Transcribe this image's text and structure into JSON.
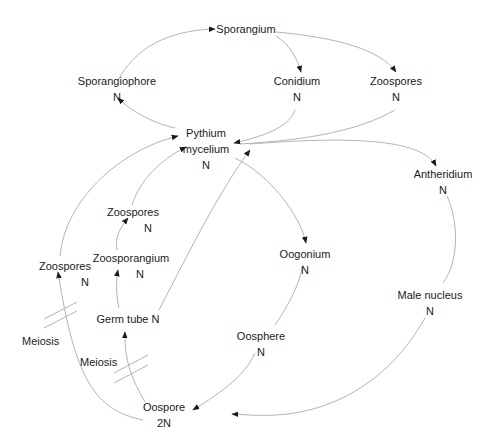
{
  "diagram": {
    "nodes": [
      {
        "id": "sporangium",
        "name": "Sporangium",
        "ploidy": ""
      },
      {
        "id": "sporangiophore",
        "name": "Sporangiophore",
        "ploidy": "N"
      },
      {
        "id": "conidium",
        "name": "Conidium",
        "ploidy": "N"
      },
      {
        "id": "zoospores_top",
        "name": "Zoospores",
        "ploidy": "N"
      },
      {
        "id": "pythium_mycelium",
        "name": "Pythium",
        "name2": "mycelium",
        "ploidy": "N"
      },
      {
        "id": "antheridium",
        "name": "Antheridium",
        "ploidy": "N"
      },
      {
        "id": "zoospores_mid",
        "name": "Zoospores",
        "ploidy": "N"
      },
      {
        "id": "zoosporangium",
        "name": "Zoosporangium",
        "ploidy": "N"
      },
      {
        "id": "zoospores_left",
        "name": "Zoospores",
        "ploidy": "N"
      },
      {
        "id": "germ_tube",
        "name": "Germ tube N",
        "ploidy": ""
      },
      {
        "id": "oogonium",
        "name": "Oogonium",
        "ploidy": "N"
      },
      {
        "id": "oosphere",
        "name": "Oosphere",
        "ploidy": "N"
      },
      {
        "id": "male_nucleus",
        "name": "Male nucleus",
        "ploidy": "N"
      },
      {
        "id": "oospore",
        "name": "Oospore",
        "ploidy": "2N"
      }
    ],
    "annotations": [
      {
        "id": "meiosis_left",
        "text": "Meiosis"
      },
      {
        "id": "meiosis_center",
        "text": "Meiosis"
      }
    ],
    "edges": [
      [
        "pythium_mycelium",
        "sporangiophore"
      ],
      [
        "sporangiophore",
        "sporangium"
      ],
      [
        "sporangium",
        "conidium"
      ],
      [
        "sporangium",
        "zoospores_top"
      ],
      [
        "conidium",
        "pythium_mycelium"
      ],
      [
        "zoospores_top",
        "pythium_mycelium"
      ],
      [
        "pythium_mycelium",
        "antheridium"
      ],
      [
        "pythium_mycelium",
        "oogonium"
      ],
      [
        "antheridium",
        "male_nucleus"
      ],
      [
        "male_nucleus",
        "oospore"
      ],
      [
        "oogonium",
        "oosphere"
      ],
      [
        "oosphere",
        "oospore"
      ],
      [
        "oospore",
        "germ_tube"
      ],
      [
        "oospore",
        "zoospores_left"
      ],
      [
        "germ_tube",
        "zoosporangium"
      ],
      [
        "germ_tube",
        "pythium_mycelium"
      ],
      [
        "zoosporangium",
        "zoospores_mid"
      ],
      [
        "zoospores_mid",
        "pythium_mycelium"
      ],
      [
        "zoospores_left",
        "pythium_mycelium"
      ]
    ],
    "colors": {
      "edge": "#b4b4b4",
      "text": "#1a1a1a",
      "arrow": "#1a1a1a"
    }
  }
}
